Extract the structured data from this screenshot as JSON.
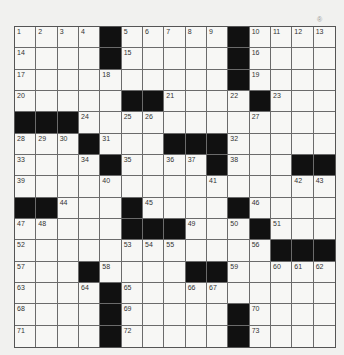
{
  "puzzle": {
    "rows": 15,
    "cols": 15,
    "corner_mark": "®",
    "colors": {
      "black": "#111111",
      "white": "#f7f7f5",
      "line": "#6b6b6b"
    },
    "grid": [
      [
        "1",
        "2",
        "3",
        "4",
        "#",
        "5",
        "6",
        "7",
        "8",
        "9",
        "#",
        "10",
        "11",
        "12",
        "13"
      ],
      [
        "14",
        "",
        "",
        "",
        "#",
        "15",
        "",
        "",
        "",
        "",
        "#",
        "16",
        "",
        "",
        ""
      ],
      [
        "17",
        "",
        "",
        "",
        "18",
        "",
        "",
        "",
        "",
        "",
        "#",
        "19",
        "",
        "",
        ""
      ],
      [
        "20",
        "",
        "",
        "",
        "",
        "#",
        "#",
        "21",
        "",
        "",
        "22",
        "#",
        "23",
        "",
        ""
      ],
      [
        "#",
        "#",
        "#",
        "24",
        "",
        "25",
        "26",
        "",
        "",
        "",
        "",
        "27",
        "",
        "",
        ""
      ],
      [
        "28",
        "29",
        "30",
        "#",
        "31",
        "",
        "",
        "#",
        "#",
        "#",
        "32",
        "",
        "",
        "",
        ""
      ],
      [
        "33",
        "",
        "",
        "34",
        "#",
        "35",
        "",
        "36",
        "37",
        "#",
        "38",
        "",
        "",
        "#",
        "#"
      ],
      [
        "39",
        "",
        "",
        "",
        "40",
        "",
        "",
        "",
        "",
        "41",
        "",
        "",
        "",
        "42",
        "43"
      ],
      [
        "#",
        "#",
        "44",
        "",
        "",
        "#",
        "45",
        "",
        "",
        "",
        "#",
        "46",
        "",
        "",
        ""
      ],
      [
        "47",
        "48",
        "",
        "",
        "",
        "#",
        "#",
        "#",
        "49",
        "",
        "50",
        "#",
        "51",
        "",
        ""
      ],
      [
        "52",
        "",
        "",
        "",
        "",
        "53",
        "54",
        "55",
        "",
        "",
        "",
        "56",
        "#",
        "#",
        "#"
      ],
      [
        "57",
        "",
        "",
        "#",
        "58",
        "",
        "",
        "",
        "#",
        "#",
        "59",
        "",
        "60",
        "61",
        "62"
      ],
      [
        "63",
        "",
        "",
        "64",
        "#",
        "65",
        "",
        "",
        "66",
        "67",
        "",
        "",
        "",
        "",
        ""
      ],
      [
        "68",
        "",
        "",
        "",
        "#",
        "69",
        "",
        "",
        "",
        "",
        "#",
        "70",
        "",
        "",
        ""
      ],
      [
        "71",
        "",
        "",
        "",
        "#",
        "72",
        "",
        "",
        "",
        "",
        "#",
        "73",
        "",
        "",
        ""
      ]
    ]
  }
}
